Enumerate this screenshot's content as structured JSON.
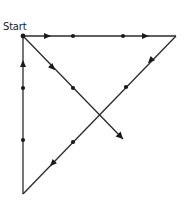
{
  "diagram": {
    "label": "Start",
    "stroke_color": "#2a2a2a",
    "points": {
      "start": [
        23,
        36
      ],
      "top_right": [
        176,
        36
      ],
      "bottom_left": [
        23,
        194
      ],
      "diagonal_end": [
        123,
        139
      ]
    },
    "path_segments": [
      {
        "name": "top-edge",
        "from": "start",
        "to": "top_right",
        "direction": "right"
      },
      {
        "name": "hypotenuse",
        "from": "top_right",
        "to": "bottom_left",
        "direction": "down-left"
      },
      {
        "name": "left-edge",
        "from": "bottom_left",
        "to": "start",
        "direction": "up"
      },
      {
        "name": "diagonal",
        "from": "start",
        "to": "diagonal_end",
        "direction": "down-right"
      }
    ],
    "arrows": [
      {
        "segment": "top-edge",
        "at": [
          48,
          36
        ],
        "angle": 0
      },
      {
        "segment": "top-edge",
        "at": [
          146,
          36
        ],
        "angle": 0
      },
      {
        "segment": "hypotenuse",
        "at": [
          150,
          61
        ],
        "angle": 134
      },
      {
        "segment": "hypotenuse",
        "at": [
          52,
          164
        ],
        "angle": 134
      },
      {
        "segment": "left-edge",
        "at": [
          23,
          63
        ],
        "angle": -90
      },
      {
        "segment": "diagonal",
        "at": [
          53,
          68
        ],
        "angle": 46
      }
    ],
    "dots": [
      [
        73,
        36
      ],
      [
        123,
        36
      ],
      [
        126,
        87
      ],
      [
        73,
        142
      ],
      [
        23,
        88
      ],
      [
        23,
        140
      ],
      [
        73,
        88
      ]
    ]
  }
}
